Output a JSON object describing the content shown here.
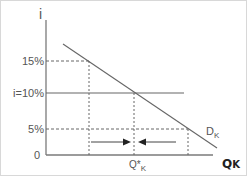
{
  "diagram": {
    "type": "capital-demand-interest-rate",
    "y_axis_label": "i",
    "x_axis_label": "Q",
    "x_axis_label_sub": "K",
    "origin_label": "0",
    "demand_curve_label": "D",
    "demand_curve_label_sub": "K",
    "equilibrium_label": "Q*",
    "equilibrium_label_sub": "K",
    "rate_levels": [
      {
        "label": "15%",
        "value": 15,
        "style": "dashed"
      },
      {
        "label": "i=10%",
        "value": 10,
        "style": "solid"
      },
      {
        "label": "5%",
        "value": 5,
        "style": "dashed"
      }
    ],
    "arrows": [
      {
        "direction": "right",
        "meaning": "adjust toward Q*K from left"
      },
      {
        "direction": "left",
        "meaning": "adjust toward Q*K from right"
      }
    ],
    "colors": {
      "line": "#666666",
      "text": "#555555",
      "frame": "#d8d8d8"
    }
  }
}
